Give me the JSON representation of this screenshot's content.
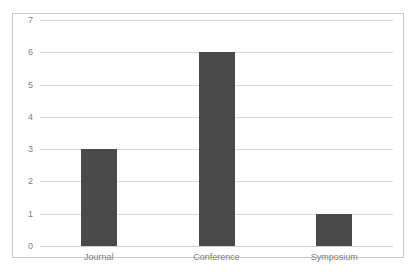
{
  "chart_data": {
    "type": "bar",
    "title": "",
    "subtitle": "",
    "xlabel": "",
    "ylabel": "",
    "categories": [
      "Journal",
      "Conference",
      "Symposium"
    ],
    "values": [
      3,
      6,
      1
    ],
    "series": [
      {
        "name": "",
        "values": [
          3,
          6,
          1
        ]
      }
    ],
    "ylim": [
      0,
      7
    ],
    "yticks": [
      0,
      1,
      2,
      3,
      4,
      5,
      6,
      7
    ],
    "ytick_labels": [
      "0",
      "1",
      "2",
      "3",
      "4",
      "5",
      "6",
      "7"
    ],
    "grid": "horizontal",
    "legend": "none",
    "annotations": [],
    "colors": {
      "bar": "#4a4a4a",
      "gridline": "#d9d9d9",
      "border": "#c8c8c8",
      "text": "#7f7f7f",
      "background": "#ffffff"
    }
  }
}
